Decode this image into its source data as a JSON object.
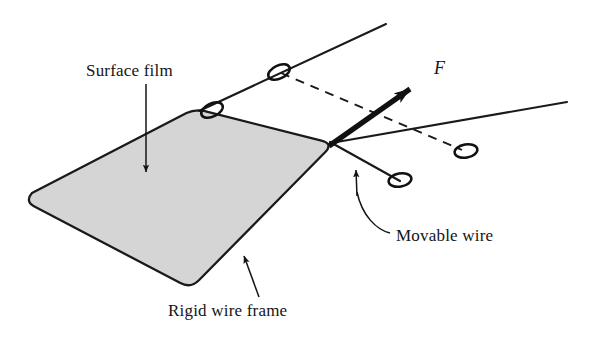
{
  "figure": {
    "type": "physics-diagram",
    "background_color": "#ffffff",
    "width": 596,
    "height": 344
  },
  "labels": {
    "surface_film": "Surface film",
    "rigid_wire_frame": "Rigid wire frame",
    "movable_wire": "Movable wire",
    "force": "F"
  },
  "colors": {
    "film_fill": "#d5d5d5",
    "outline": "#1a1a1a",
    "text": "#141414",
    "wire": "#1a1a1a"
  },
  "geometry": {
    "film_polygon": [
      [
        200,
        110
      ],
      [
        330,
        143
      ],
      [
        190,
        285
      ],
      [
        28,
        200
      ]
    ],
    "film_corner_radius": 14,
    "upper_wire": [
      [
        200,
        110
      ],
      [
        385,
        25
      ]
    ],
    "lower_wire": [
      [
        330,
        143
      ],
      [
        565,
        103
      ]
    ],
    "movable_wire": [
      [
        330,
        143
      ],
      [
        400,
        180
      ]
    ],
    "rings": [
      [
        212,
        110
      ],
      [
        278,
        72
      ],
      [
        399,
        180
      ],
      [
        465,
        151
      ]
    ],
    "dashed_line": [
      [
        278,
        72
      ],
      [
        465,
        151
      ]
    ],
    "force_arrow": [
      [
        330,
        143
      ],
      [
        428,
        76
      ]
    ]
  },
  "annotations": [
    {
      "name": "surface-film",
      "text": "Surface film",
      "arrow_from": [
        146,
        84
      ],
      "arrow_to": [
        146,
        172
      ],
      "style": "straight-arrow"
    },
    {
      "name": "rigid-wire-frame",
      "text": "Rigid wire frame",
      "arrow_from": [
        258,
        296
      ],
      "arrow_to": [
        243,
        258
      ],
      "style": "straight-arrow"
    },
    {
      "name": "movable-wire",
      "text": "Movable wire",
      "arrow_from": [
        388,
        234
      ],
      "arrow_to": [
        356,
        173
      ],
      "style": "curved-leader-arrow"
    },
    {
      "name": "force",
      "text": "F",
      "arrow_from": [
        330,
        143
      ],
      "arrow_to": [
        428,
        76
      ],
      "style": "thick-vector-arrow"
    }
  ]
}
